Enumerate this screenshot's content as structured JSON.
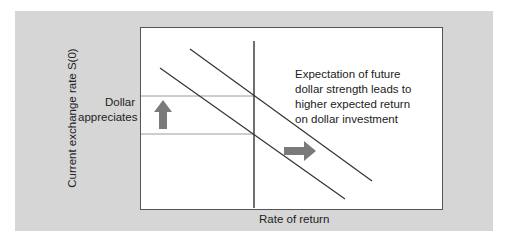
{
  "diagram": {
    "y_axis_label": "Current exchange rate S(0)",
    "x_axis_label": "Rate of return",
    "left_annotation": [
      "Dollar",
      "appreciates"
    ],
    "right_annotation": [
      "Expectation of future",
      "dollar strength leads to",
      "higher expected return",
      "on dollar investment"
    ],
    "arrows": [
      {
        "direction": "up",
        "meaning": "dollar appreciates"
      },
      {
        "direction": "right",
        "meaning": "expected return curve shifts right"
      }
    ],
    "curves": [
      {
        "name": "expected-return-initial",
        "from": [
          160,
          68
        ],
        "to": [
          345,
          199
        ]
      },
      {
        "name": "expected-return-shifted",
        "from": [
          190,
          49
        ],
        "to": [
          372,
          181
        ]
      }
    ],
    "colors": {
      "panel": "#d6d6d6",
      "plot_bg": "#ffffff",
      "line": "#333333",
      "guide": "#999999",
      "arrow": "#7a7a7a"
    }
  }
}
